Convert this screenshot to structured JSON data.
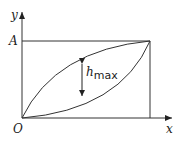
{
  "diagram": {
    "axes": {
      "x_label": "x",
      "y_label": "y",
      "origin_label": "O",
      "level_label": "A"
    },
    "annotation": {
      "symbol": "h",
      "subscript": "max"
    },
    "colors": {
      "line": "#333333",
      "background": "#ffffff"
    }
  }
}
